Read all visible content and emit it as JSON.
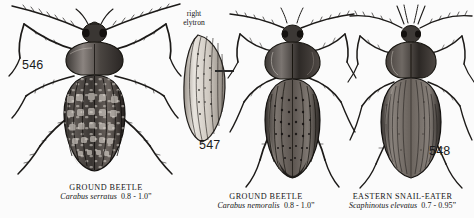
{
  "plate": {
    "title": "Ground Beetles plate",
    "background_color": "#fbfbfb",
    "ink_color": "#1a1a1a"
  },
  "annotation": {
    "elytron_line1": "right",
    "elytron_line2": "elytron"
  },
  "figures": [
    {
      "number": "546",
      "common_name": "GROUND BEETLE",
      "scientific_name": "Carabus serratus",
      "size": "0.8 - 1.0”"
    },
    {
      "number": "547",
      "common_name": "GROUND BEETLE",
      "scientific_name": "Carabus nemoralis",
      "size": "0.8 - 1.0”"
    },
    {
      "number": "548",
      "common_name": "EASTERN SNAIL-EATER",
      "scientific_name": "Scaphinotus elevatus",
      "size": "0.7 - 0.95”"
    }
  ]
}
